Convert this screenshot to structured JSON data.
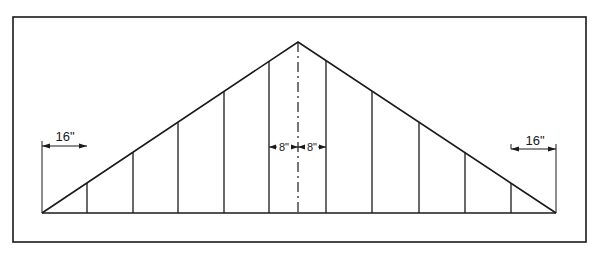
{
  "diagram": {
    "frame": {
      "x": 13,
      "y": 17,
      "width": 573,
      "height": 225
    },
    "colors": {
      "line": "#1a1a1a",
      "background": "#ffffff"
    },
    "triangle": {
      "left": [
        42,
        213
      ],
      "apex": [
        298,
        42
      ],
      "right": [
        556,
        213
      ]
    },
    "center_line_x": 298,
    "stud_x": [
      87,
      133,
      178,
      224,
      269,
      326,
      372,
      419,
      465,
      511
    ],
    "dimensions": {
      "left_spacing": {
        "label": "16\"",
        "x1": 42,
        "x2": 87,
        "y": 146
      },
      "right_spacing": {
        "label": "16\"",
        "x1": 511,
        "x2": 556,
        "y": 149
      },
      "center_left": {
        "label": "8\"",
        "x1": 269,
        "x2": 298,
        "y": 147
      },
      "center_right": {
        "label": "8\"",
        "x1": 298,
        "x2": 326,
        "y": 147
      }
    }
  }
}
